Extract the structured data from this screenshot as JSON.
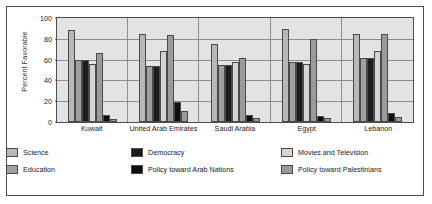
{
  "chart_data": {
    "type": "bar",
    "title": "",
    "xlabel": "",
    "ylabel": "Percent Favorable",
    "ylim": [
      0,
      100
    ],
    "yticks": [
      0,
      20,
      40,
      60,
      80,
      100
    ],
    "grid": true,
    "legend_position": "bottom",
    "categories": [
      "Kuwait",
      "United Arab Emirates",
      "Saudi Arabia",
      "Egypt",
      "Lebanon"
    ],
    "series": [
      {
        "name": "Science",
        "color": "#b8b8b8",
        "values": [
          88,
          85,
          75,
          89,
          85
        ]
      },
      {
        "name": "Education",
        "color": "#a0a0a0",
        "values": [
          60,
          54,
          55,
          58,
          62
        ]
      },
      {
        "name": "Democracy",
        "color": "#1c1c1c",
        "values": [
          60,
          54,
          55,
          58,
          62
        ]
      },
      {
        "name": "Policy toward Arab Nations",
        "color": "#0d0d0d",
        "values": [
          7,
          19,
          7,
          6,
          9
        ]
      },
      {
        "name": "Movies and Television",
        "color": "#d4d4d4",
        "values": [
          56,
          68,
          58,
          56,
          68
        ]
      },
      {
        "name": "Policy toward Palestinians",
        "color": "#9a9a9a",
        "values": [
          66,
          84,
          62,
          80,
          85
        ]
      }
    ],
    "bars_by_group": [
      {
        "category": "Kuwait",
        "bars": [
          {
            "series": "Science",
            "value": 88,
            "shade": "s0"
          },
          {
            "series": "Education",
            "value": 60,
            "shade": "s1"
          },
          {
            "series": "Democracy",
            "value": 60,
            "shade": "s2"
          },
          {
            "series": "Movies and Television",
            "value": 56,
            "shade": "s4"
          },
          {
            "series": "Policy toward Palestinians",
            "value": 66,
            "shade": "s5"
          },
          {
            "series": "Policy toward Arab Nations",
            "value": 7,
            "shade": "s3"
          },
          {
            "series": "Policy toward Palestinians (low)",
            "value": 3,
            "shade": "s5"
          }
        ]
      },
      {
        "category": "United Arab Emirates",
        "bars": [
          {
            "series": "Science",
            "value": 85,
            "shade": "s0"
          },
          {
            "series": "Education",
            "value": 54,
            "shade": "s1"
          },
          {
            "series": "Democracy",
            "value": 54,
            "shade": "s2"
          },
          {
            "series": "Movies and Television",
            "value": 68,
            "shade": "s4"
          },
          {
            "series": "Policy toward Palestinians",
            "value": 84,
            "shade": "s5"
          },
          {
            "series": "Policy toward Arab Nations",
            "value": 19,
            "shade": "s3"
          },
          {
            "series": "Policy toward Palestinians (low)",
            "value": 11,
            "shade": "s5"
          }
        ]
      },
      {
        "category": "Saudi Arabia",
        "bars": [
          {
            "series": "Science",
            "value": 75,
            "shade": "s0"
          },
          {
            "series": "Education",
            "value": 55,
            "shade": "s1"
          },
          {
            "series": "Democracy",
            "value": 55,
            "shade": "s2"
          },
          {
            "series": "Movies and Television",
            "value": 58,
            "shade": "s4"
          },
          {
            "series": "Policy toward Palestinians",
            "value": 62,
            "shade": "s5"
          },
          {
            "series": "Policy toward Arab Nations",
            "value": 7,
            "shade": "s3"
          },
          {
            "series": "Policy toward Palestinians (low)",
            "value": 4,
            "shade": "s5"
          }
        ]
      },
      {
        "category": "Egypt",
        "bars": [
          {
            "series": "Science",
            "value": 89,
            "shade": "s0"
          },
          {
            "series": "Education",
            "value": 58,
            "shade": "s1"
          },
          {
            "series": "Democracy",
            "value": 58,
            "shade": "s2"
          },
          {
            "series": "Movies and Television",
            "value": 56,
            "shade": "s4"
          },
          {
            "series": "Policy toward Palestinians",
            "value": 80,
            "shade": "s5"
          },
          {
            "series": "Policy toward Arab Nations",
            "value": 6,
            "shade": "s3"
          },
          {
            "series": "Policy toward Palestinians (low)",
            "value": 4,
            "shade": "s5"
          }
        ]
      },
      {
        "category": "Lebanon",
        "bars": [
          {
            "series": "Science",
            "value": 85,
            "shade": "s0"
          },
          {
            "series": "Education",
            "value": 62,
            "shade": "s1"
          },
          {
            "series": "Democracy",
            "value": 62,
            "shade": "s2"
          },
          {
            "series": "Movies and Television",
            "value": 68,
            "shade": "s4"
          },
          {
            "series": "Policy toward Palestinians",
            "value": 85,
            "shade": "s5"
          },
          {
            "series": "Policy toward Arab Nations",
            "value": 9,
            "shade": "s3"
          },
          {
            "series": "Policy toward Palestinians (low)",
            "value": 5,
            "shade": "s5"
          }
        ]
      }
    ],
    "legend": [
      {
        "label": "Science",
        "shade": "s0"
      },
      {
        "label": "Democracy",
        "shade": "s2"
      },
      {
        "label": "Movies and Television",
        "shade": "s4"
      },
      {
        "label": "Education",
        "shade": "s1"
      },
      {
        "label": "Policy toward Arab Nations",
        "shade": "s3"
      },
      {
        "label": "Policy toward Palestinians",
        "shade": "s5"
      }
    ]
  }
}
